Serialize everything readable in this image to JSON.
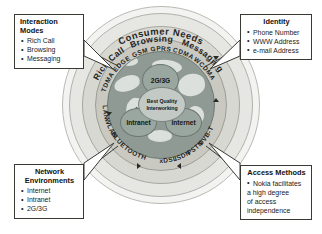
{
  "diagram": {
    "rings": {
      "outer_label": "Consumer Needs",
      "interaction_modes": [
        "Rich Call",
        "Browsing",
        "Messaging"
      ],
      "technologies_top": [
        "TDMA",
        "EDGE",
        "GSM",
        "GPRS",
        "CDMA",
        "WCDMA"
      ],
      "technologies_left": [
        "LAN",
        "WLAN",
        "BLUETOOTH"
      ],
      "technologies_bottom": [
        "xDSL",
        "ISDN",
        "PSTN",
        "DVB-T"
      ]
    },
    "core": {
      "hub_label_line1": "Best Quality",
      "hub_label_line2": "Interworking",
      "nodes": [
        {
          "name": "mobile-network",
          "label": "2G/3G"
        },
        {
          "name": "intranet",
          "label": "Intranet"
        },
        {
          "name": "internet",
          "label": "Internet"
        }
      ]
    }
  },
  "callouts": {
    "interaction_modes": {
      "title": "Interaction Modes",
      "items": [
        "Rich Call",
        "Browsing",
        "Messaging"
      ]
    },
    "identity": {
      "title": "Identity",
      "items": [
        "Phone Number",
        "WWW Address",
        "e-mail Address"
      ]
    },
    "network_environments": {
      "title_line1": "Network",
      "title_line2": "Environments",
      "items": [
        "Internet",
        "Intranet",
        "2G/3G"
      ]
    },
    "access_methods": {
      "title": "Access Methods",
      "item_line1": "Nokia facilitates",
      "item_line2": "a high degree",
      "item_line3": "of access",
      "item_line4": "independence"
    }
  },
  "colors": {
    "ring_outer": "#f3f3f1",
    "ring_needs": "#e6e6e2",
    "ring_modes": "#d8d8d2",
    "ring_tech": "#c9c9c2",
    "globe": "#8e9a93",
    "node": "#9aa6a0",
    "hub": "#c3c9c4",
    "line": "#3a3a35"
  }
}
